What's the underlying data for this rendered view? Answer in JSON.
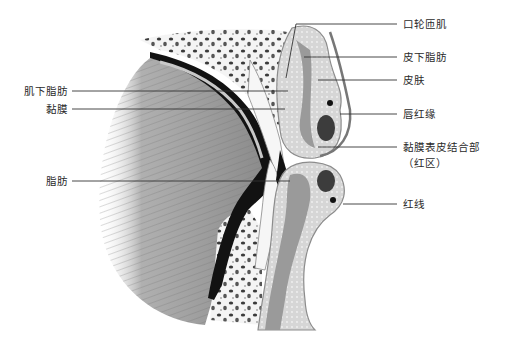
{
  "figure": {
    "colors": {
      "ink": "#1a1a1a",
      "tissue_light": "#d8d8d8",
      "tissue_mid": "#a8a8a8",
      "muscle": "#8a8a8a",
      "dark": "#111111",
      "leader": "#333333"
    }
  },
  "labels_right": [
    {
      "id": "orbicularis-oris",
      "text": "口轮匝肌"
    },
    {
      "id": "subcutaneous-fat",
      "text": "皮下脂肪"
    },
    {
      "id": "skin",
      "text": "皮肤"
    },
    {
      "id": "vermilion-border",
      "text": "唇红缘"
    },
    {
      "id": "mucocutaneous-junction",
      "text": "黏膜表皮结合部"
    },
    {
      "id": "red-zone",
      "text": "（红区）"
    },
    {
      "id": "red-line",
      "text": "红线"
    }
  ],
  "labels_left": [
    {
      "id": "submuscular-fat",
      "text": "肌下脂肪"
    },
    {
      "id": "mucosa",
      "text": "黏膜"
    },
    {
      "id": "fat",
      "text": "脂肪"
    }
  ]
}
